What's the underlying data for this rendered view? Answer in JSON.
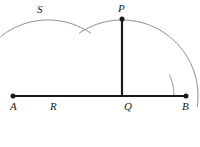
{
  "figure": {
    "kind": "geometry-construction-diagram",
    "canvas": {
      "width": 200,
      "height": 147,
      "background": "#ffffff"
    },
    "colors": {
      "line": "#1a1a1a",
      "arc": "#7a7a82",
      "label": "#1a1a1a",
      "background": "#ffffff"
    },
    "labels": {
      "A": "A",
      "B": "B",
      "P": "P",
      "Q": "Q",
      "R": "R",
      "S": "S"
    },
    "points": [
      {
        "name": "A",
        "label": "A",
        "x": 13,
        "y": 96,
        "marker": "dot",
        "label_x": 10,
        "label_y": 101
      },
      {
        "name": "B",
        "label": "B",
        "x": 186,
        "y": 96,
        "marker": "dot",
        "label_x": 182,
        "label_y": 101
      },
      {
        "name": "P",
        "label": "P",
        "x": 122,
        "y": 19,
        "marker": "dot",
        "label_x": 118,
        "label_y": 3
      },
      {
        "name": "Q",
        "label": "Q",
        "x": 122,
        "y": 96,
        "marker": "none",
        "label_x": 124,
        "label_y": 101
      },
      {
        "name": "R",
        "label": "R",
        "x": 48,
        "y": 96,
        "marker": "none",
        "label_x": 50,
        "label_y": 101
      },
      {
        "name": "S",
        "label": "S",
        "x": 46,
        "y": 20,
        "marker": "none",
        "label_x": 37,
        "label_y": 4
      }
    ],
    "segments": [
      {
        "name": "line-AB",
        "from": "A",
        "to": "B",
        "x1": 13,
        "y1": 96,
        "x2": 186,
        "y2": 96,
        "width": 2.2
      },
      {
        "name": "segment-PQ",
        "from": "P",
        "to": "Q",
        "x1": 122,
        "y1": 19,
        "x2": 122,
        "y2": 96,
        "width": 2.2
      }
    ],
    "arcs": [
      {
        "name": "arc-from-R",
        "center_x": 48,
        "center_y": 96,
        "radius": 76,
        "start_deg": 172,
        "end_deg": 304,
        "width": 0.9
      },
      {
        "name": "arc-from-Q",
        "center_x": 122,
        "center_y": 96,
        "radius": 76,
        "start_deg": 236,
        "end_deg": 368,
        "width": 0.9
      },
      {
        "name": "arc-top-from-R-wide",
        "center_x": 48,
        "center_y": 96,
        "radius": 114,
        "start_deg": 229,
        "end_deg": 283,
        "width": 0.9
      },
      {
        "name": "arc-right-from-Q-wide",
        "center_x": 122,
        "center_y": 96,
        "radius": 52,
        "start_deg": 336,
        "end_deg": 360,
        "width": 0.9
      }
    ]
  }
}
